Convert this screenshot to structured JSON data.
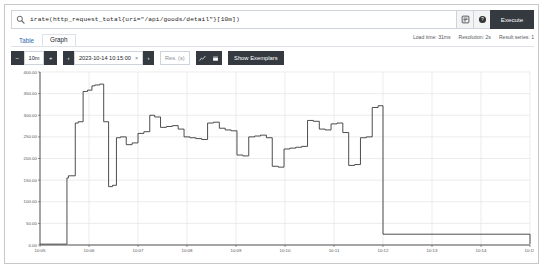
{
  "query": {
    "text": "irate(http_request_total{uri=\"/api/goods/detail\"}[10m])",
    "execute_label": "Execute",
    "metrics_explorer_icon": "list-icon",
    "help_icon": "question-circle-icon",
    "search_icon": "search-icon"
  },
  "tabs": [
    {
      "label": "Table",
      "active": false
    },
    {
      "label": "Graph",
      "active": true
    }
  ],
  "meta": {
    "load_time": "Load time: 31ms",
    "resolution": "Resolution: 2s",
    "result_series": "Result series: 1"
  },
  "controls": {
    "decrease_label": "−",
    "range_value": "10m",
    "increase_label": "+",
    "prev_label": "‹",
    "end_time": "2023-10-14 10:15:00",
    "clear_time_label": "×",
    "next_label": "›",
    "resolution_placeholder": "Res. (s)",
    "resolution_value": "",
    "line_chart_icon": "line-chart-icon",
    "stacked_chart_icon": "stacked-chart-icon",
    "show_exemplars_label": "Show Exemplars"
  },
  "colors": {
    "accent": "#343a40",
    "border": "#ced4da",
    "grid": "#e2e2e2",
    "line": "#3a3a3a",
    "link": "#2b6cb0"
  },
  "chart_data": {
    "type": "line",
    "title": "",
    "xlabel": "",
    "ylabel": "",
    "ylim": [
      0,
      400
    ],
    "yticks": [
      0,
      50,
      100,
      150,
      200,
      250,
      300,
      350,
      400
    ],
    "ytick_labels": [
      "0.00",
      "50.00",
      "100.00",
      "150.00",
      "200.00",
      "250.00",
      "300.00",
      "350.00",
      "400.00"
    ],
    "xlim": [
      "10:05",
      "10:15"
    ],
    "xticks": [
      "10:05",
      "10:06",
      "10:07",
      "10:08",
      "10:09",
      "10:10",
      "10:11",
      "10:12",
      "10:13",
      "10:14",
      "10:15"
    ],
    "grid": true,
    "legend": "none",
    "step_interpolation": true,
    "series": [
      {
        "name": "irate(http_request_total{uri=\"/api/goods/detail\"}[10m])",
        "color": "#3a3a3a",
        "x": [
          0.0,
          0.4,
          0.55,
          0.58,
          0.72,
          0.78,
          0.88,
          0.97,
          1.06,
          1.12,
          1.22,
          1.3,
          1.4,
          1.48,
          1.56,
          1.64,
          1.76,
          1.88,
          2.0,
          2.12,
          2.24,
          2.34,
          2.46,
          2.58,
          2.7,
          2.82,
          2.94,
          3.06,
          3.18,
          3.3,
          3.42,
          3.54,
          3.66,
          3.78,
          3.9,
          4.02,
          4.14,
          4.26,
          4.38,
          4.5,
          4.62,
          4.74,
          4.86,
          4.98,
          5.1,
          5.22,
          5.34,
          5.46,
          5.58,
          5.7,
          5.82,
          5.94,
          6.06,
          6.18,
          6.3,
          6.42,
          6.54,
          6.66,
          6.78,
          6.9,
          7.0
        ],
        "y": [
          2,
          2,
          155,
          160,
          282,
          285,
          355,
          358,
          368,
          370,
          372,
          285,
          135,
          138,
          248,
          250,
          232,
          236,
          258,
          262,
          300,
          296,
          272,
          274,
          276,
          268,
          250,
          248,
          246,
          244,
          282,
          284,
          270,
          266,
          264,
          208,
          206,
          250,
          252,
          254,
          248,
          182,
          180,
          222,
          224,
          226,
          228,
          288,
          286,
          268,
          266,
          280,
          282,
          260,
          184,
          186,
          248,
          250,
          318,
          322,
          25
        ],
        "tail": {
          "drop_time": 7.0,
          "plateau_value": 25,
          "final_value": 2
        }
      }
    ]
  }
}
